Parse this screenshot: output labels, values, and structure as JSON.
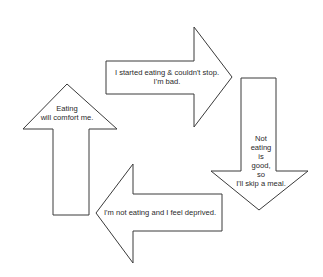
{
  "diagram": {
    "type": "cycle",
    "direction": "clockwise",
    "stroke_color": "#3a3a3a",
    "background": "#ffffff",
    "arrows": [
      {
        "id": "top",
        "direction": "right",
        "text": "I started eating & couldn't stop.\nI'm bad."
      },
      {
        "id": "right",
        "direction": "down",
        "text": "Not\neating\nis\ngood,\nso\nI'll skip a meal."
      },
      {
        "id": "bottom",
        "direction": "left",
        "text": "I'm not eating and I feel deprived."
      },
      {
        "id": "left",
        "direction": "up",
        "text": "Eating\nwill comfort me."
      }
    ]
  }
}
